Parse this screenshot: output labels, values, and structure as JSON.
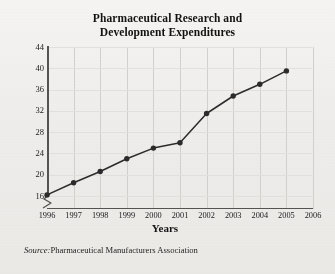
{
  "chart_data": {
    "type": "line",
    "title": "Pharmaceutical Research and Development Expenditures",
    "title_line1": "Pharmaceutical Research and",
    "title_line2": "Development Expenditures",
    "xlabel": "Years",
    "ylabel": "Dollars (in billions)",
    "x": [
      1996,
      1997,
      1998,
      1999,
      2000,
      2001,
      2002,
      2003,
      2004,
      2005
    ],
    "values": [
      16.2,
      18.5,
      20.6,
      23.0,
      25.0,
      26.0,
      31.5,
      34.8,
      37.0,
      39.5
    ],
    "xticks": [
      "1996",
      "1997",
      "1998",
      "1999",
      "2000",
      "2001",
      "2002",
      "2003",
      "2004",
      "2005",
      "2006"
    ],
    "yticks": [
      "16",
      "20",
      "24",
      "28",
      "32",
      "36",
      "40",
      "44"
    ],
    "xlim": [
      1996,
      2006
    ],
    "ylim": [
      16,
      44
    ],
    "grid": true,
    "legend": "none",
    "axis_break": "y-axis broken below 16",
    "marker": "filled-circle",
    "line_color": "#2b2b2b",
    "grid_color": "#d2d1cd",
    "axis_color": "#55534f"
  },
  "source": {
    "label": "Source:",
    "text": "Pharmaceutical Manufacturers Association"
  }
}
